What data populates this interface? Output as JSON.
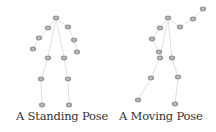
{
  "figures": [
    {
      "id": "standing",
      "caption": "A Standing Pose",
      "nodes": {
        "neck": [
          56,
          18
        ],
        "l_shoulder": [
          48,
          28
        ],
        "r_shoulder": [
          68,
          27
        ],
        "l_elbow": [
          39,
          38
        ],
        "r_elbow": [
          74,
          40
        ],
        "l_hand": [
          33,
          49
        ],
        "r_hand": [
          77,
          52
        ],
        "l_hip": [
          48,
          58
        ],
        "r_hip": [
          64,
          58
        ],
        "l_knee": [
          41,
          79
        ],
        "r_knee": [
          68,
          79
        ],
        "l_foot": [
          42,
          105
        ],
        "r_foot": [
          69,
          105
        ]
      }
    },
    {
      "id": "moving",
      "caption": "A Moving Pose",
      "nodes": {
        "neck": [
          168,
          18
        ],
        "l_shoulder": [
          160,
          28
        ],
        "r_shoulder": [
          180,
          27
        ],
        "l_elbow": [
          152,
          39
        ],
        "r_elbow": [
          193,
          19
        ],
        "l_hand": [
          159,
          52
        ],
        "r_hand": [
          203,
          9
        ],
        "l_hip": [
          160,
          58
        ],
        "r_hip": [
          172,
          58
        ],
        "l_knee": [
          151,
          78
        ],
        "r_knee": [
          178,
          77
        ],
        "l_foot": [
          138,
          100
        ],
        "r_foot": [
          175,
          104
        ]
      }
    }
  ],
  "edges": [
    [
      "neck",
      "l_shoulder"
    ],
    [
      "neck",
      "r_shoulder"
    ],
    [
      "l_shoulder",
      "l_elbow"
    ],
    [
      "l_elbow",
      "l_hand"
    ],
    [
      "r_shoulder",
      "r_elbow"
    ],
    [
      "r_elbow",
      "r_hand"
    ],
    [
      "neck",
      "l_hip"
    ],
    [
      "neck",
      "r_hip"
    ],
    [
      "l_hip",
      "l_knee"
    ],
    [
      "l_knee",
      "l_foot"
    ],
    [
      "r_hip",
      "r_knee"
    ],
    [
      "r_knee",
      "r_foot"
    ]
  ],
  "style": {
    "edge_color": "#dcdcdc",
    "node_fill": "#9a9a9a",
    "node_inner": "#c4c4c4"
  }
}
